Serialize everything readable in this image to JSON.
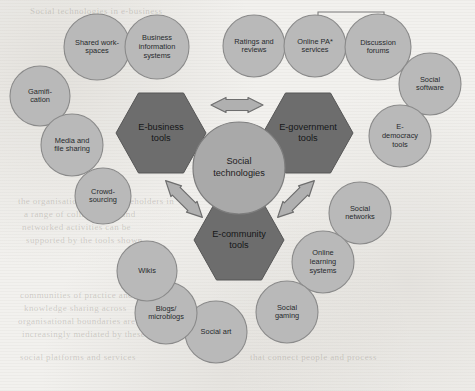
{
  "figure": {
    "title": "Social technologies",
    "center": {
      "label_line1": "Social",
      "label_line2": "technologies",
      "cx": 239,
      "cy": 168,
      "r": 46
    },
    "hexagons": [
      {
        "name": "e-business",
        "label_line1": "E-business",
        "label_line2": "tools",
        "cx": 161,
        "cy": 133,
        "rx": 45,
        "ry": 40
      },
      {
        "name": "e-government",
        "label_line1": "E-government",
        "label_line2": "tools",
        "cx": 308,
        "cy": 133,
        "rx": 45,
        "ry": 40
      },
      {
        "name": "e-community",
        "label_line1": "E-community",
        "label_line2": "tools",
        "cx": 239,
        "cy": 240,
        "rx": 45,
        "ry": 40
      }
    ],
    "arrows": [
      {
        "name": "arrow-business-government",
        "orientation": "horizontal",
        "cx": 237,
        "cy": 105
      },
      {
        "name": "arrow-business-community",
        "orientation": "diagonal-nwse",
        "cx": 184,
        "cy": 199
      },
      {
        "name": "arrow-government-community",
        "orientation": "diagonal-nesw",
        "cx": 296,
        "cy": 199
      }
    ],
    "bracket": {
      "name": "pa-services-forums-bracket",
      "x1": 318,
      "x2": 384,
      "y_top": 12,
      "y_drop": 24
    },
    "circles": [
      {
        "name": "shared-workspaces",
        "label_line1": "Shared work-",
        "label_line2": "spaces",
        "cx": 97,
        "cy": 47,
        "r": 33
      },
      {
        "name": "business-information-systems",
        "label_line1": "Business",
        "label_line2": "information",
        "label_line3": "systems",
        "cx": 157,
        "cy": 47,
        "r": 32
      },
      {
        "name": "gamification",
        "label_line1": "Gamifi-",
        "label_line2": "cation",
        "cx": 40,
        "cy": 96,
        "r": 30
      },
      {
        "name": "media-and-file-sharing",
        "label_line1": "Media and",
        "label_line2": "file sharing",
        "cx": 72,
        "cy": 145,
        "r": 31
      },
      {
        "name": "crowdsourcing",
        "label_line1": "Crowd-",
        "label_line2": "sourcing",
        "cx": 103,
        "cy": 196,
        "r": 28
      },
      {
        "name": "ratings-and-reviews",
        "label_line1": "Ratings and",
        "label_line2": "reviews",
        "cx": 254,
        "cy": 46,
        "r": 31
      },
      {
        "name": "online-pa-services",
        "label_line1": "Online PA*",
        "label_line2": "services",
        "cx": 315,
        "cy": 46,
        "r": 31
      },
      {
        "name": "discussion-forums",
        "label_line1": "Discussion",
        "label_line2": "forums",
        "cx": 378,
        "cy": 47,
        "r": 33
      },
      {
        "name": "social-software",
        "label_line1": "Social",
        "label_line2": "software",
        "cx": 430,
        "cy": 84,
        "r": 31
      },
      {
        "name": "e-democracy-tools",
        "label_line1": "E-",
        "label_line2": "democracy",
        "label_line3": "tools",
        "cx": 400,
        "cy": 136,
        "r": 31
      },
      {
        "name": "social-networks",
        "label_line1": "Social",
        "label_line2": "networks",
        "cx": 360,
        "cy": 213,
        "r": 31
      },
      {
        "name": "online-learning-systems",
        "label_line1": "Online",
        "label_line2": "learning",
        "label_line3": "systems",
        "cx": 323,
        "cy": 262,
        "r": 31
      },
      {
        "name": "social-gaming",
        "label_line1": "Social",
        "label_line2": "gaming",
        "cx": 287,
        "cy": 312,
        "r": 31
      },
      {
        "name": "social-art",
        "label_line1": "Social art",
        "cx": 216,
        "cy": 332,
        "r": 31
      },
      {
        "name": "blogs-microblogs",
        "label_line1": "Blogs/",
        "label_line2": "microblogs",
        "cx": 166,
        "cy": 313,
        "r": 31
      },
      {
        "name": "wikis",
        "label_line1": "Wikis",
        "cx": 147,
        "cy": 271,
        "r": 30
      }
    ],
    "ghost_lines": [
      {
        "text": "Social technologies in e-business",
        "x": 30,
        "y": 6
      },
      {
        "text": "the organisation and its stakeholders in",
        "x": 18,
        "y": 196
      },
      {
        "text": "a range of collaborative and",
        "x": 24,
        "y": 209
      },
      {
        "text": "networked activities can be",
        "x": 22,
        "y": 222
      },
      {
        "text": "supported by the tools shown",
        "x": 26,
        "y": 235
      },
      {
        "text": "communities of practice and",
        "x": 20,
        "y": 290
      },
      {
        "text": "knowledge sharing across",
        "x": 24,
        "y": 303
      },
      {
        "text": "organisational boundaries are",
        "x": 18,
        "y": 316
      },
      {
        "text": "increasingly mediated by these",
        "x": 22,
        "y": 329
      },
      {
        "text": "social platforms and services",
        "x": 20,
        "y": 352
      },
      {
        "text": "that connect people and process",
        "x": 250,
        "y": 352
      }
    ],
    "colors": {
      "background": "#f2f1ee",
      "circle_fill": "#b9b9b9",
      "center_fill": "#a9a9a9",
      "hexagon_fill": "#6d6d6d",
      "arrow_fill": "#b0b0b0",
      "outline": "#7b7b7b"
    }
  }
}
